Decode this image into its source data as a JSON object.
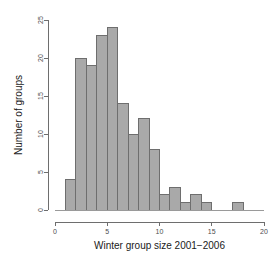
{
  "chart_data": {
    "type": "bar",
    "title": "",
    "subtitle": "",
    "xlabel": "Winter group size 2001−2006",
    "ylabel": "Number of groups",
    "xlim": [
      0,
      20
    ],
    "ylim": [
      0,
      25
    ],
    "grid": false,
    "legend": false,
    "legend_position": "none",
    "bin_width": 1,
    "bin_starts": [
      1,
      2,
      3,
      4,
      5,
      6,
      7,
      8,
      9,
      10,
      11,
      12,
      13,
      14,
      17
    ],
    "bin_ends": [
      2,
      3,
      4,
      5,
      6,
      7,
      8,
      9,
      10,
      11,
      12,
      13,
      14,
      15,
      18
    ],
    "categories": [
      "1-2",
      "2-3",
      "3-4",
      "4-5",
      "5-6",
      "6-7",
      "7-8",
      "8-9",
      "9-10",
      "10-11",
      "11-12",
      "12-13",
      "13-14",
      "14-15",
      "17-18"
    ],
    "values": [
      4,
      20,
      19,
      23,
      24,
      14,
      10,
      12,
      8,
      2,
      3,
      1,
      2,
      1,
      1
    ],
    "xticks": [
      0,
      5,
      10,
      15,
      20
    ],
    "xtick_labels": [
      "0",
      "5",
      "10",
      "15",
      "20"
    ],
    "yticks": [
      0,
      5,
      10,
      15,
      20,
      25
    ],
    "ytick_labels": [
      "0",
      "5",
      "10",
      "15",
      "20",
      "25"
    ],
    "bar_fill_color": "#a9a9a9",
    "bar_border_color": "#6e6e6e",
    "axis_color": "#6e6e6e",
    "text_color": "#1a1a1a"
  }
}
